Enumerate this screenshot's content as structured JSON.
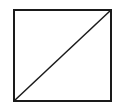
{
  "diagram": {
    "background": "#ffffff",
    "stroke_color": "#1a1a1a",
    "square": {
      "x": 14,
      "y": 10,
      "width": 97,
      "height": 91,
      "stroke_width": 2
    },
    "diagonal": {
      "from": [
        14,
        101
      ],
      "to": [
        111,
        10
      ],
      "stroke_width": 1.5
    }
  }
}
